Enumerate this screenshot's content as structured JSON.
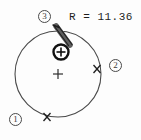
{
  "diagram": {
    "type": "circle-measurement",
    "background_color": "#fdfdfd",
    "line_color": "#3a3a3a",
    "radius_label": "R = 11.36",
    "radius_value": 11.36,
    "circle": {
      "center_x": 58,
      "center_y": 74,
      "radius_px": 43,
      "stroke_color": "#4a4a4a"
    },
    "center_marker": {
      "name": "center-cross",
      "symbol": "+",
      "x": 58,
      "y": 74
    },
    "target_marker": {
      "name": "crosshair-target",
      "symbol": "circled-plus",
      "x": 61,
      "y": 52,
      "color": "#1a1a1a"
    },
    "probe_line": {
      "name": "probe-bar",
      "x1": 56,
      "y1": 26,
      "x2": 70,
      "y2": 45,
      "color": "#555555"
    },
    "point_markers": [
      {
        "name": "point-marker-right",
        "symbol": "x",
        "x": 97,
        "y": 69
      },
      {
        "name": "point-marker-bottom",
        "symbol": "x",
        "x": 47,
        "y": 117
      }
    ],
    "callouts": [
      {
        "id": "callout-1",
        "label": "①",
        "text": "1",
        "x": 9,
        "y": 113
      },
      {
        "id": "callout-2",
        "label": "②",
        "text": "2",
        "x": 109,
        "y": 59
      },
      {
        "id": "callout-3",
        "label": "③",
        "text": "3",
        "x": 38,
        "y": 10
      }
    ]
  }
}
